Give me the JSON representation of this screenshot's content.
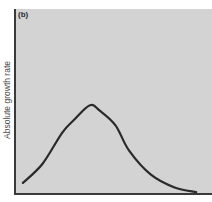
{
  "figure": {
    "panel_label": "(b)",
    "background_color": "#ffffff",
    "plot_background_color": "#d3d3d3",
    "axis_color": "#3a3a3a",
    "curve_color": "#2a2a2a"
  },
  "chart_data": {
    "type": "line",
    "title": "",
    "panel_label": "(b)",
    "xlabel": "",
    "ylabel": "Absolute growth rate",
    "xlim": [
      0,
      1
    ],
    "ylim": [
      0,
      1
    ],
    "grid": false,
    "legend": null,
    "tick_labels": {
      "x": [],
      "y": []
    },
    "series": [
      {
        "name": "Absolute growth rate",
        "x": [
          0.04,
          0.14,
          0.24,
          0.3,
          0.38,
          0.43,
          0.51,
          0.58,
          0.69,
          0.81,
          0.92
        ],
        "y": [
          0.055,
          0.16,
          0.33,
          0.4,
          0.48,
          0.45,
          0.37,
          0.23,
          0.1,
          0.03,
          0.005
        ]
      }
    ],
    "annotations": []
  }
}
